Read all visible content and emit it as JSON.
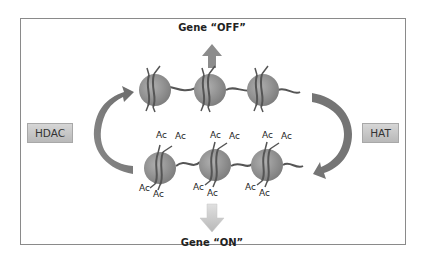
{
  "diagram": {
    "title_top": "Gene “OFF”",
    "title_bottom": "Gene “ON”",
    "enzymes": {
      "left": "HDAC",
      "right": "HAT"
    },
    "acetyl_label": "Ac",
    "top_row": {
      "state": "deacetylated",
      "nucleosome_count": 3
    },
    "bottom_row": {
      "state": "acetylated",
      "nucleosome_count": 3,
      "acetyl_groups_per_nucleosome": 4
    },
    "arrows": {
      "up": "to gene off",
      "down": "to gene on",
      "left_cycle": "HDAC: acetylated to deacetylated",
      "right_cycle": "HAT: deacetylated to acetylated"
    },
    "colors": {
      "nucleosome": "#8f8f8f",
      "dna": "#5a5a5a",
      "cycle_arrow": "#7a7a7a",
      "up_arrow": "#8c8c8c",
      "down_arrow": "#c9c9c9",
      "frame_border": "#8a8a8a"
    }
  }
}
